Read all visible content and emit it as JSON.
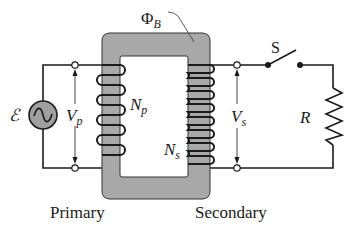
{
  "diagram": {
    "type": "transformer-circuit",
    "labels": {
      "flux": "Φ",
      "flux_sub": "B",
      "emf": "ℰ",
      "primary_voltage": "V",
      "primary_voltage_sub": "p",
      "primary_turns": "N",
      "primary_turns_sub": "p",
      "secondary_voltage": "V",
      "secondary_voltage_sub": "s",
      "secondary_turns": "N",
      "secondary_turns_sub": "s",
      "switch": "S",
      "resistor": "R",
      "primary_caption": "Primary",
      "secondary_caption": "Secondary"
    },
    "components": {
      "source": "ac-source",
      "core": "iron-core",
      "primary_coil_turns_drawn": 4,
      "secondary_coil_turns_drawn": 8,
      "switch_state": "open"
    },
    "colors": {
      "core_fill": "#a8a8a8",
      "wire": "#1a1a1a",
      "source_fill": "#a0a0a0",
      "background": "#ffffff"
    }
  }
}
